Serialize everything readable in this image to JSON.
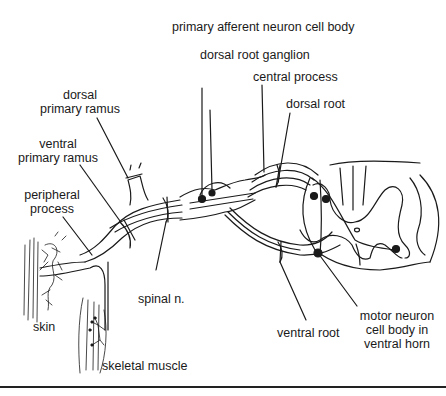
{
  "labels": {
    "primary_afferent": "primary afferent neuron cell body",
    "drg": "dorsal root ganglion",
    "central_process": "central process",
    "dorsal_root": "dorsal root",
    "dorsal_ramus_1": "dorsal",
    "dorsal_ramus_2": "primary ramus",
    "ventral_ramus_1": "ventral",
    "ventral_ramus_2": "primary ramus",
    "peripheral_1": "peripheral",
    "peripheral_2": "process",
    "spinal_n": "spinal n.",
    "skin": "skin",
    "skeletal_muscle": "skeletal muscle",
    "ventral_root": "ventral root",
    "motor_1": "motor neuron",
    "motor_2": "cell body in",
    "motor_3": "ventral horn"
  },
  "colors": {
    "ink": "#1a1a1a",
    "background": "#ffffff"
  }
}
